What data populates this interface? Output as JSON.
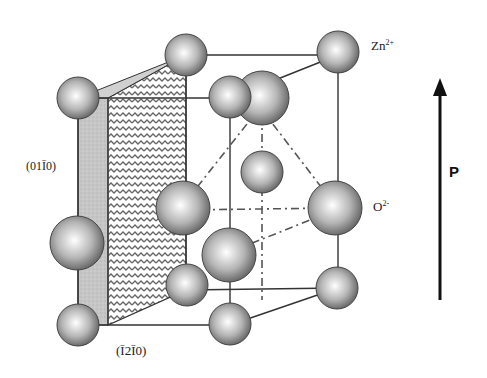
{
  "diagram": {
    "labels": {
      "zn_ion": "Zn",
      "zn_charge": "2+",
      "o_ion": "O",
      "o_charge": "2-",
      "plane_left": "(01Ī0)",
      "plane_bottom": "(Ī2Ī0)",
      "polarization": "P"
    },
    "colors": {
      "atom_light": "#f4f4f4",
      "atom_dark": "#555555",
      "line": "#333333",
      "plane_gray": "#c8c8c8",
      "plane_hatch": "#666666",
      "arrow": "#111111"
    }
  }
}
